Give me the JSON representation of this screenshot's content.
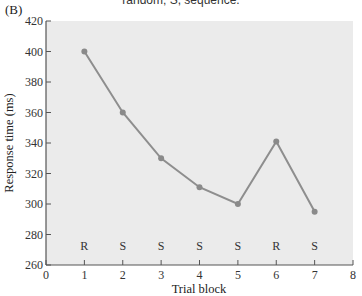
{
  "figure": {
    "panel_label": "(B)",
    "top_caption": "random; S, sequence."
  },
  "colors": {
    "plot_bg": "#ebebeb",
    "line": "#8e8e8e",
    "marker": "#8a8a8a",
    "axis": "#555555"
  },
  "chart_data": {
    "type": "line",
    "title": "",
    "xlabel": "Trial block",
    "ylabel": "Response time (ms)",
    "x": [
      1,
      2,
      3,
      4,
      5,
      6,
      7
    ],
    "series": [
      {
        "name": "Response time",
        "values": [
          400,
          360,
          330,
          311,
          300,
          341,
          295
        ]
      }
    ],
    "condition_labels": [
      "R",
      "S",
      "S",
      "S",
      "S",
      "R",
      "S"
    ],
    "xlim": [
      0,
      8
    ],
    "ylim": [
      260,
      420
    ],
    "xticks": [
      0,
      1,
      2,
      3,
      4,
      5,
      6,
      7,
      8
    ],
    "yticks": [
      260,
      280,
      300,
      320,
      340,
      360,
      380,
      400,
      420
    ],
    "grid": false,
    "legend": null
  }
}
